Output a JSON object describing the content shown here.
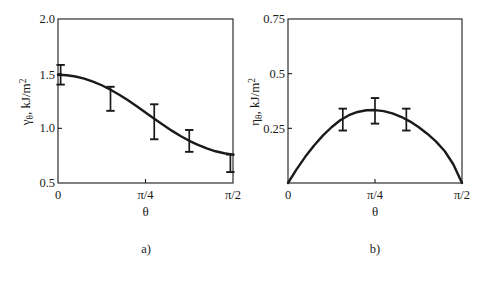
{
  "figure": {
    "background": "#ffffff",
    "ink_color": "#1a1a1a",
    "panel_a_caption": "a)",
    "panel_b_caption": "b)"
  },
  "chart_data": [
    {
      "type": "line",
      "panel": "a)",
      "title": "",
      "xlabel": "θ",
      "ylabel": "γθ, kJ/m2",
      "ylabel_parts": {
        "symbol": "γ",
        "subscript": "θ",
        "units": ", kJ/m",
        "exponent": "2"
      },
      "xlim": [
        0,
        1.5707963
      ],
      "ylim": [
        0.5,
        2.0
      ],
      "xticks": [
        0,
        0.7853982,
        1.5707963
      ],
      "xticklabels": [
        "0",
        "π/4",
        "π/2"
      ],
      "yticks": [
        0.5,
        1.0,
        1.5,
        2.0
      ],
      "yticklabels": [
        "0.5",
        "1.0",
        "1.5",
        "2.0"
      ],
      "grid": false,
      "legend": "none",
      "curve": {
        "x": [
          0.0,
          0.0785,
          0.1571,
          0.2356,
          0.3142,
          0.3927,
          0.4712,
          0.5498,
          0.6283,
          0.7069,
          0.7854,
          0.8639,
          0.9425,
          1.021,
          1.0996,
          1.1781,
          1.2566,
          1.3352,
          1.4137,
          1.4923,
          1.5708
        ],
        "y": [
          1.49,
          1.486,
          1.474,
          1.455,
          1.428,
          1.394,
          1.353,
          1.307,
          1.256,
          1.202,
          1.145,
          1.088,
          1.032,
          0.979,
          0.93,
          0.886,
          0.848,
          0.816,
          0.79,
          0.772,
          0.76
        ]
      },
      "errorbars": [
        {
          "x": 0.0236,
          "y": 1.49,
          "minus": 0.09,
          "plus": 0.09
        },
        {
          "x": 0.4712,
          "y": 1.275,
          "minus": 0.115,
          "plus": 0.105
        },
        {
          "x": 0.8639,
          "y": 1.065,
          "minus": 0.165,
          "plus": 0.155
        },
        {
          "x": 1.1781,
          "y": 0.89,
          "minus": 0.105,
          "plus": 0.095
        },
        {
          "x": 1.5472,
          "y": 0.68,
          "minus": 0.08,
          "plus": 0.08
        }
      ]
    },
    {
      "type": "line",
      "panel": "b)",
      "title": "",
      "xlabel": "θ",
      "ylabel": "ηθ, kJ/m2",
      "ylabel_parts": {
        "symbol": "η",
        "subscript": "θ",
        "units": ", kJ/m",
        "exponent": "2"
      },
      "xlim": [
        0,
        1.5707963
      ],
      "ylim": [
        0,
        0.75
      ],
      "xticks": [
        0,
        0.7853982,
        1.5707963
      ],
      "xticklabels": [
        "0",
        "π/4",
        "π/2"
      ],
      "yticks": [
        0.25,
        0.5,
        0.75
      ],
      "yticklabels": [
        "0.25",
        "0.5",
        "0.75"
      ],
      "grid": false,
      "legend": "none",
      "curve": {
        "x": [
          0.0,
          0.0785,
          0.1571,
          0.2356,
          0.3142,
          0.3927,
          0.4712,
          0.5498,
          0.6283,
          0.7069,
          0.7854,
          0.8639,
          0.9425,
          1.021,
          1.0996,
          1.1781,
          1.2566,
          1.3352,
          1.4137,
          1.4923,
          1.5708
        ],
        "y": [
          0.0,
          0.0635,
          0.1208,
          0.1718,
          0.2165,
          0.2549,
          0.2871,
          0.3099,
          0.3248,
          0.3325,
          0.3335,
          0.3288,
          0.3185,
          0.3028,
          0.2819,
          0.2561,
          0.2255,
          0.1904,
          0.1463,
          0.0857,
          0.0
        ]
      },
      "errorbars": [
        {
          "x": 0.4948,
          "y": 0.288,
          "minus": 0.048,
          "plus": 0.052
        },
        {
          "x": 0.7854,
          "y": 0.3335,
          "minus": 0.062,
          "plus": 0.055
        },
        {
          "x": 1.0682,
          "y": 0.288,
          "minus": 0.048,
          "plus": 0.052
        }
      ]
    }
  ]
}
